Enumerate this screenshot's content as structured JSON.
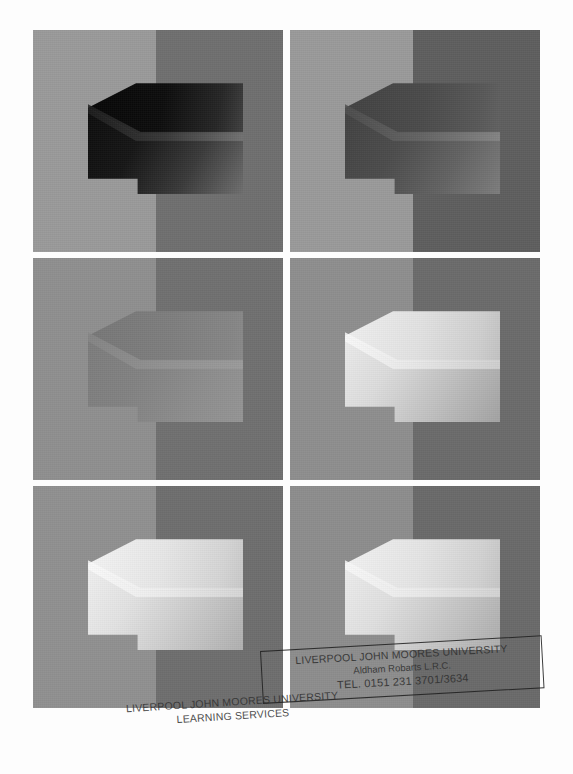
{
  "figure": {
    "caption": "",
    "layout": {
      "rows": 3,
      "columns": 2,
      "panel_count": 6
    },
    "panels": [
      {
        "id": "panel-1",
        "position": "row-1-left",
        "label": "",
        "background_left": "#9a9a9a",
        "background_right": "#6f6f6f",
        "block_top_face": "#101010",
        "block_front_face": "#1a1a1a",
        "block_bevel": "#8c8c8c",
        "block_lightness": "very dark",
        "description": "3D block rendered very dark against split light/dark background"
      },
      {
        "id": "panel-2",
        "position": "row-1-right",
        "label": "",
        "background_left": "#9a9a9a",
        "background_right": "#5e5e5e",
        "block_top_face": "#4a4a4a",
        "block_front_face": "#535353",
        "block_bevel": "#8a8a8a",
        "block_lightness": "dark",
        "description": "3D block rendered dark grey against split light/dark background"
      },
      {
        "id": "panel-3",
        "position": "row-2-left",
        "label": "",
        "background_left": "#8f8f8f",
        "background_right": "#707070",
        "block_top_face": "#7f7f7f",
        "block_front_face": "#868686",
        "block_bevel": "#959595",
        "block_lightness": "mid grey",
        "description": "3D block rendered mid grey, low contrast with background"
      },
      {
        "id": "panel-4",
        "position": "row-2-right",
        "label": "",
        "background_left": "#8e8e8e",
        "background_right": "#6b6b6b",
        "block_top_face": "#d2d2d2",
        "block_front_face": "#c0c0c0",
        "block_bevel": "#efefef",
        "block_lightness": "light",
        "description": "3D block rendered light grey against split background"
      },
      {
        "id": "panel-5",
        "position": "row-3-left",
        "label": "",
        "background_left": "#909090",
        "background_right": "#6e6e6e",
        "block_top_face": "#dcdcdc",
        "block_front_face": "#cccccc",
        "block_bevel": "#f2f2f2",
        "block_lightness": "very light",
        "description": "3D block rendered very light grey against split background"
      },
      {
        "id": "panel-6",
        "position": "row-3-right",
        "label": "",
        "background_left": "#8d8d8d",
        "background_right": "#6a6a6a",
        "block_top_face": "#dadada",
        "block_front_face": "#cacaca",
        "block_bevel": "#f0f0f0",
        "block_lightness": "very light",
        "description": "3D block rendered very light grey against split background"
      }
    ]
  },
  "stamps": {
    "boxed": {
      "line1": "LIVERPOOL JOHN MOORES UNIVERSITY",
      "line2": "Aldham Robarts L.R.C.",
      "line3": "TEL. 0151 231 3701/3634"
    },
    "plain": {
      "line1": "LIVERPOOL JOHN MOORES UNIVERSITY",
      "line2": "LEARNING SERVICES"
    }
  },
  "page": {
    "background_color": "#fdfdfd",
    "width": 573,
    "height": 774
  }
}
